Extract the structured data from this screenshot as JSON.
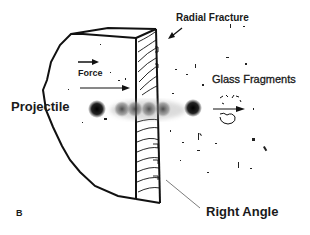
{
  "diagram": {
    "panel_label": "B",
    "labels": {
      "radial_fracture": "Radial Fracture",
      "force": "Force",
      "glass_fragments": "Glass Fragments",
      "projectile": "Projectile",
      "right_angle": "Right Angle"
    },
    "colors": {
      "line": "#111111",
      "background": "#ffffff",
      "projectile": "#1a1a1a"
    }
  }
}
